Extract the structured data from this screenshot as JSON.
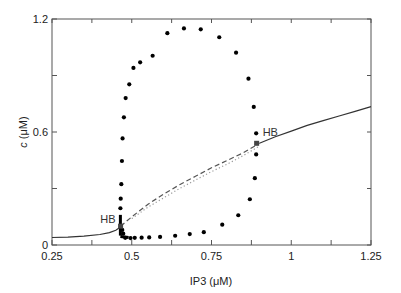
{
  "chart_data": {
    "type": "scatter",
    "title": "",
    "xlabel": "IP3 (μM)",
    "ylabel_italic": "c",
    "ylabel_unit": " (μM)",
    "ylabel": "c (μM)",
    "xlim": [
      0.25,
      1.25
    ],
    "ylim": [
      0,
      1.2
    ],
    "grid": false,
    "legend": null,
    "x_ticks": [
      0.25,
      0.375,
      0.5,
      0.625,
      0.75,
      0.875,
      1.0,
      1.125,
      1.25
    ],
    "x_tick_labels": [
      {
        "value": 0.25,
        "label": "0.25"
      },
      {
        "value": 0.5,
        "label": "0.5"
      },
      {
        "value": 0.75,
        "label": "0.75"
      },
      {
        "value": 1.0,
        "label": "1"
      },
      {
        "value": 1.25,
        "label": "1.25"
      }
    ],
    "y_ticks": [
      0,
      0.3,
      0.6,
      0.9,
      1.2
    ],
    "y_tick_labels": [
      {
        "value": 0,
        "label": "0"
      },
      {
        "value": 0.6,
        "label": "0.6"
      },
      {
        "value": 1.2,
        "label": "1.2"
      }
    ],
    "series": [
      {
        "name": "stable steady state (left branch)",
        "style": "solid",
        "color": "#333333",
        "x": [
          0.25,
          0.3,
          0.35,
          0.4,
          0.43,
          0.45,
          0.46,
          0.465
        ],
        "y": [
          0.04,
          0.042,
          0.047,
          0.056,
          0.066,
          0.078,
          0.09,
          0.1
        ]
      },
      {
        "name": "unstable steady state",
        "style": "dashed",
        "color": "#555555",
        "x": [
          0.465,
          0.5,
          0.55,
          0.6,
          0.65,
          0.7,
          0.75,
          0.8,
          0.85,
          0.9
        ],
        "y": [
          0.1,
          0.15,
          0.215,
          0.27,
          0.32,
          0.365,
          0.41,
          0.45,
          0.49,
          0.54
        ]
      },
      {
        "name": "unstable periodic orbit average",
        "style": "dotted",
        "color": "#999999",
        "x": [
          0.5,
          0.55,
          0.6,
          0.65,
          0.7,
          0.75,
          0.8,
          0.85,
          0.9
        ],
        "y": [
          0.14,
          0.2,
          0.25,
          0.3,
          0.345,
          0.39,
          0.43,
          0.475,
          0.525
        ]
      },
      {
        "name": "stable steady state (right branch)",
        "style": "solid",
        "color": "#333333",
        "x": [
          0.9,
          0.95,
          1.0,
          1.05,
          1.1,
          1.15,
          1.2,
          1.25
        ],
        "y": [
          0.54,
          0.575,
          0.605,
          0.635,
          0.66,
          0.685,
          0.71,
          0.735
        ]
      },
      {
        "name": "periodic orbit max/min",
        "style": "markers",
        "marker": "circle",
        "color": "#000000",
        "x": [
          0.4644,
          0.4654,
          0.4673,
          0.4692,
          0.4712,
          0.4754,
          0.4809,
          0.4922,
          0.5053,
          0.5263,
          0.5655,
          0.6116,
          0.6636,
          0.7163,
          0.7743,
          0.827,
          0.8659,
          0.8825,
          0.89,
          0.89,
          0.8859,
          0.8702,
          0.8339,
          0.7837,
          0.7259,
          0.6818,
          0.6361,
          0.5888,
          0.5547,
          0.531,
          0.5094,
          0.4962,
          0.4796,
          0.4733,
          0.4702
        ],
        "y": [
          0.195,
          0.246,
          0.323,
          0.446,
          0.566,
          0.678,
          0.78,
          0.853,
          0.94,
          0.97,
          1.005,
          1.125,
          1.15,
          1.145,
          1.103,
          1.021,
          0.883,
          0.733,
          0.593,
          0.481,
          0.355,
          0.243,
          0.158,
          0.108,
          0.068,
          0.058,
          0.049,
          0.043,
          0.04,
          0.039,
          0.038,
          0.037,
          0.038,
          0.06,
          0.08
        ]
      }
    ],
    "annotations": [
      {
        "text": "HB",
        "x": 0.465,
        "y": 0.1,
        "position": "left",
        "marker": "square"
      },
      {
        "text": "HB",
        "x": 0.8915,
        "y": 0.54,
        "position": "above-right",
        "marker": "square"
      }
    ]
  },
  "style": {
    "frame_color": "#555555",
    "line_color": "#333333",
    "dash_color": "#555555",
    "dot_color": "#000000",
    "dotted_color": "#9a9a9a"
  }
}
